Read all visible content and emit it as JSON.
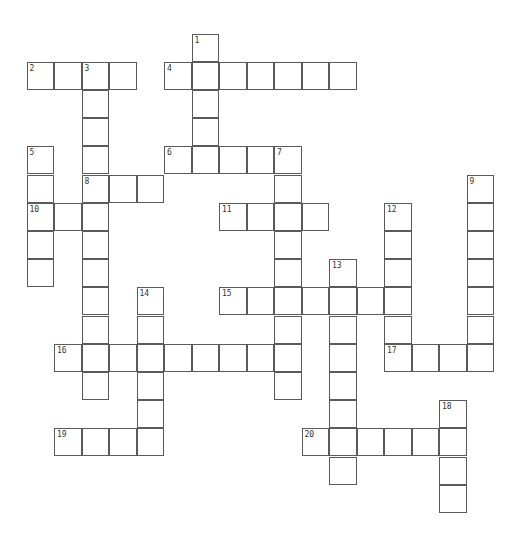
{
  "puzzle": {
    "grid": {
      "origin_x": 27,
      "origin_y": 34,
      "cell_w": 27.5,
      "cell_h": 28.2
    },
    "across": [
      {
        "number": "2",
        "row": 1,
        "col": 0,
        "length": 4
      },
      {
        "number": "4",
        "row": 1,
        "col": 5,
        "length": 7
      },
      {
        "number": "6",
        "row": 4,
        "col": 5,
        "length": 5
      },
      {
        "number": "8",
        "row": 5,
        "col": 2,
        "length": 3
      },
      {
        "number": "10",
        "row": 6,
        "col": 0,
        "length": 3
      },
      {
        "number": "11",
        "row": 6,
        "col": 7,
        "length": 4
      },
      {
        "number": "15",
        "row": 9,
        "col": 7,
        "length": 7
      },
      {
        "number": "16",
        "row": 11,
        "col": 1,
        "length": 9
      },
      {
        "number": "17",
        "row": 11,
        "col": 13,
        "length": 4
      },
      {
        "number": "19",
        "row": 14,
        "col": 1,
        "length": 4
      },
      {
        "number": "20",
        "row": 14,
        "col": 10,
        "length": 6
      }
    ],
    "down": [
      {
        "number": "1",
        "row": 0,
        "col": 6,
        "length": 5
      },
      {
        "number": "3",
        "row": 1,
        "col": 2,
        "length": 12
      },
      {
        "number": "5",
        "row": 4,
        "col": 0,
        "length": 5
      },
      {
        "number": "7",
        "row": 4,
        "col": 9,
        "length": 9
      },
      {
        "number": "9",
        "row": 5,
        "col": 16,
        "length": 7
      },
      {
        "number": "12",
        "row": 6,
        "col": 13,
        "length": 6
      },
      {
        "number": "13",
        "row": 8,
        "col": 11,
        "length": 8
      },
      {
        "number": "14",
        "row": 9,
        "col": 4,
        "length": 6
      },
      {
        "number": "18",
        "row": 13,
        "col": 15,
        "length": 4
      }
    ]
  }
}
